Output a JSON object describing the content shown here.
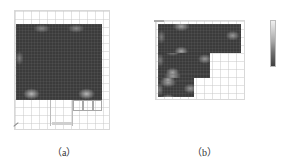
{
  "figure": {
    "panels": [
      {
        "id": "a",
        "caption": "（a）",
        "description": "Full floor heatmap with grid and lower-right cells"
      },
      {
        "id": "b",
        "caption": "（b）",
        "description": "L-shaped floor heatmap with colorbar"
      }
    ],
    "colors": {
      "heat_dark": "#3b3b3b",
      "heat_light": "#dcdcdc",
      "grid": "#d8d8d8",
      "background": "#ffffff"
    }
  }
}
